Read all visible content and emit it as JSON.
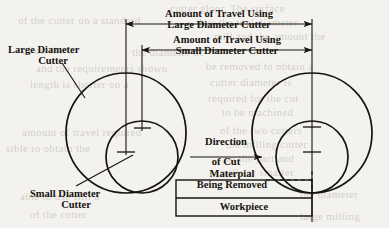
{
  "figure": {
    "type": "engineering-diagram",
    "background_color": "#f4f2ee",
    "ink_color": "#16140f"
  },
  "dimensions": {
    "travel_large": {
      "line1": "Amount of Travel Using",
      "line2": "Large Diameter Cutter"
    },
    "travel_small": {
      "line1": "Amount of Travel Using",
      "line2": "Small Diameter Cutter"
    }
  },
  "labels": {
    "large_cutter": {
      "line1": "Large Diameter",
      "line2": "Cutter"
    },
    "small_cutter": {
      "line1": "Small Diameter",
      "line2": "Cutter"
    },
    "direction_of_cut": {
      "line1": "Direction",
      "line2": "of Cut"
    },
    "material_removed": {
      "line1": "Materpial",
      "line2": "Being Removed"
    },
    "workpiece": "Workpiece"
  },
  "ghost_text": [
    {
      "text": "cutter gloor. The surface",
      "x": 170,
      "y": 2
    },
    {
      "text": "of the cutter on a standard",
      "x": 18,
      "y": 14
    },
    {
      "text": "thus the tool diameter",
      "x": 196,
      "y": 16
    },
    {
      "text": "mill and the amount the",
      "x": 214,
      "y": 30
    },
    {
      "text": "as on the",
      "x": 22,
      "y": 44
    },
    {
      "text": "the diameter of",
      "x": 132,
      "y": 46
    },
    {
      "text": "and the requirements shown",
      "x": 36,
      "y": 62
    },
    {
      "text": "be removed to obtain a",
      "x": 206,
      "y": 60
    },
    {
      "text": "length is shorter on a",
      "x": 30,
      "y": 78
    },
    {
      "text": "cutter diameter is",
      "x": 210,
      "y": 76
    },
    {
      "text": "required for the cut",
      "x": 208,
      "y": 92
    },
    {
      "text": "to be machined",
      "x": 222,
      "y": 106
    },
    {
      "text": "amount of travel required",
      "x": 22,
      "y": 126
    },
    {
      "text": "of the two cutters",
      "x": 220,
      "y": 124
    },
    {
      "text": "sible to obtain the",
      "x": 6,
      "y": 142
    },
    {
      "text": "the milling cutter",
      "x": 226,
      "y": 138
    },
    {
      "text": "on the part and",
      "x": 224,
      "y": 152
    },
    {
      "text": "mills or smaller",
      "x": 220,
      "y": 166
    },
    {
      "text": "able to use still a",
      "x": 20,
      "y": 190
    },
    {
      "text": "the diameter",
      "x": 300,
      "y": 188
    },
    {
      "text": "of the cutter",
      "x": 30,
      "y": 208
    },
    {
      "text": "large milling",
      "x": 300,
      "y": 210
    }
  ],
  "geometry": {
    "left_assembly": {
      "large_circle": {
        "cx": 126,
        "cy": 133,
        "r": 60
      },
      "small_circle": {
        "cx": 142,
        "cy": 157,
        "r": 36
      },
      "large_center_tick_y": 152,
      "small_center_tick_y": 128
    },
    "right_assembly": {
      "large_circle": {
        "cx": 312,
        "cy": 133,
        "r": 60
      },
      "small_circle": {
        "cx": 312,
        "cy": 157,
        "r": 36
      },
      "large_center_tick_y": 152,
      "small_center_tick_y": 127
    },
    "workpiece_box": {
      "x": 176,
      "y": 180,
      "width": 136,
      "height": 36
    },
    "material_line_y": 198,
    "dim_line_large_y": 24,
    "dim_line_small_y": 50,
    "extension_left_large_x": 126,
    "extension_left_small_x": 142,
    "extension_right_x": 312
  }
}
